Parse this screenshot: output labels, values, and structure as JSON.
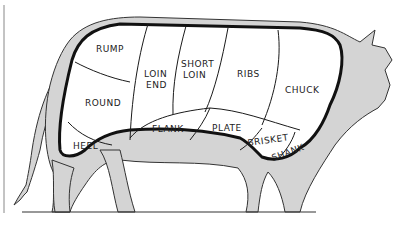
{
  "colors": {
    "hide": "#d4d4d4",
    "outline": "#1a1a1a",
    "background": "#ffffff"
  },
  "cuts": [
    {
      "id": "rump",
      "label": "RUMP"
    },
    {
      "id": "round",
      "label": "ROUND"
    },
    {
      "id": "loin-end",
      "label_line1": "LOIN",
      "label_line2": "END"
    },
    {
      "id": "short-loin",
      "label_line1": "SHORT",
      "label_line2": "LOIN"
    },
    {
      "id": "ribs",
      "label": "RIBS"
    },
    {
      "id": "chuck",
      "label": "CHUCK"
    },
    {
      "id": "heel",
      "label": "HEEL"
    },
    {
      "id": "flank",
      "label": "FLANK"
    },
    {
      "id": "plate",
      "label": "PLATE"
    },
    {
      "id": "brisket",
      "label": "BRISKET"
    },
    {
      "id": "shank",
      "label": "SHANK"
    }
  ]
}
